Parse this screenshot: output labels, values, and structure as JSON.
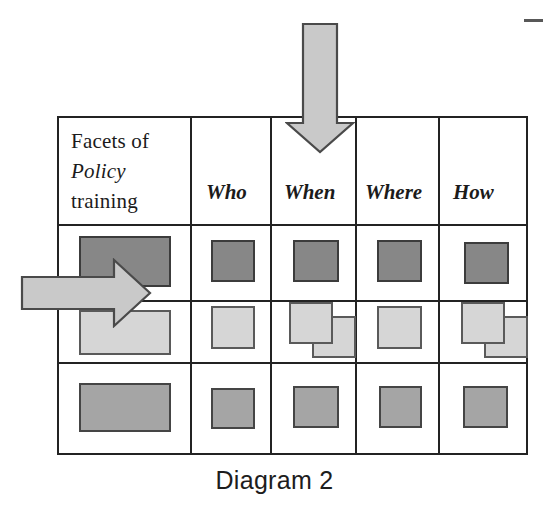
{
  "figure": {
    "caption": "Diagram 2",
    "corner_mark": "dash-mark"
  },
  "table": {
    "header": {
      "row_label_line1": "Facets of",
      "row_label_line2": "Policy",
      "row_label_line3": "training",
      "columns": [
        "Who",
        "When",
        "Where",
        "How"
      ]
    },
    "rows": [
      {
        "fill": "#878787",
        "label": "row-1-dark",
        "cells": [
          {
            "column": "facets",
            "shapes": 1
          },
          {
            "column": "Who",
            "shapes": 1
          },
          {
            "column": "When",
            "shapes": 1
          },
          {
            "column": "Where",
            "shapes": 1
          },
          {
            "column": "How",
            "shapes": 1
          }
        ]
      },
      {
        "fill": "#d6d6d6",
        "label": "row-2-light",
        "cells": [
          {
            "column": "facets",
            "shapes": 1
          },
          {
            "column": "Who",
            "shapes": 1
          },
          {
            "column": "When",
            "shapes": 2
          },
          {
            "column": "Where",
            "shapes": 1
          },
          {
            "column": "How",
            "shapes": 2
          }
        ]
      },
      {
        "fill": "#a5a5a5",
        "label": "row-3-medium",
        "cells": [
          {
            "column": "facets",
            "shapes": 1
          },
          {
            "column": "Who",
            "shapes": 1
          },
          {
            "column": "When",
            "shapes": 1
          },
          {
            "column": "Where",
            "shapes": 1
          },
          {
            "column": "How",
            "shapes": 1
          }
        ]
      }
    ]
  },
  "annotations": {
    "down_arrow": {
      "name": "down-arrow",
      "points_to": "When",
      "fill": "#c9c9c9"
    },
    "right_arrow": {
      "name": "right-arrow",
      "points_to": "row-1-dark",
      "fill": "#c9c9c9"
    }
  },
  "colors": {
    "grid_line": "#232323",
    "dark_fill": "#878787",
    "light_fill": "#d6d6d6",
    "medium_fill": "#a5a5a5",
    "arrow_fill": "#c9c9c9",
    "arrow_stroke": "#4a4a4a",
    "text": "#1b1b1b",
    "background": "#ffffff"
  }
}
